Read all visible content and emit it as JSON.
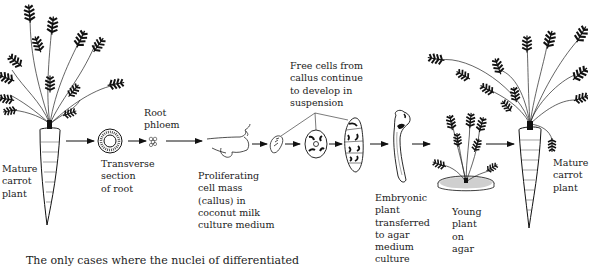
{
  "diagram": {
    "type": "process-flow",
    "stages": [
      {
        "id": "mature-plant-start",
        "label": "Mature\ncarrot\nplant"
      },
      {
        "id": "transverse-section",
        "label": "Transverse\nsection\nof root"
      },
      {
        "id": "root-phloem",
        "label": "Root\nphloem"
      },
      {
        "id": "callus",
        "label": "Proliferating\ncell mass\n(callus) in\ncoconut milk\nculture medium"
      },
      {
        "id": "free-cells",
        "label": "Free cells from\ncallus continue\nto develop in\nsuspension"
      },
      {
        "id": "embryonic-plant",
        "label": "Embryonic\nplant\ntransferred\nto agar\nmedium\nculture"
      },
      {
        "id": "young-plant",
        "label": "Young\nplant\non\nagar"
      },
      {
        "id": "mature-plant-end",
        "label": "Mature\ncarrot\nplant"
      }
    ],
    "edges": [
      [
        "mature-plant-start",
        "transverse-section"
      ],
      [
        "transverse-section",
        "root-phloem"
      ],
      [
        "root-phloem",
        "callus"
      ],
      [
        "callus",
        "free-cells"
      ],
      [
        "free-cells",
        "embryonic-plant"
      ],
      [
        "embryonic-plant",
        "young-plant"
      ],
      [
        "young-plant",
        "mature-plant-end"
      ]
    ]
  },
  "body_text": "The only cases where the nuclei of differentiated"
}
